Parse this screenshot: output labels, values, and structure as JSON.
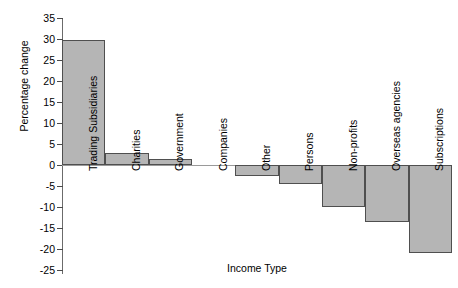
{
  "chart_data": {
    "type": "bar",
    "title": "",
    "subtitle": "",
    "xlabel": "Income Type",
    "ylabel": "Percentage change",
    "categories": [
      "Trading Subsidiaries",
      "Charities",
      "Government",
      "Companies",
      "Other",
      "Persons",
      "Non-profits",
      "Overseas agencies",
      "Subscriptions"
    ],
    "values": [
      29.8,
      2.8,
      1.5,
      0,
      -2.5,
      -4.5,
      -10,
      -13.5,
      -21
    ],
    "series": [
      {
        "name": "Percentage change",
        "values": [
          29.8,
          2.8,
          1.5,
          0,
          -2.5,
          -4.5,
          -10,
          -13.5,
          -21
        ]
      }
    ],
    "ylim": [
      -25,
      35
    ],
    "ytick_step": 5,
    "yticks": [
      35,
      30,
      25,
      20,
      15,
      10,
      5,
      0,
      -5,
      -10,
      -15,
      -20,
      -25
    ],
    "ytick_labels": [
      "35",
      "30",
      "25",
      "20",
      "15",
      "10",
      "5",
      "0",
      "-5",
      "-10",
      "-15",
      "-20",
      "-25"
    ],
    "grid": false,
    "legend": "none",
    "bar_fill_color": "#b5b5b5",
    "bar_edge_color": "#4f4f4f",
    "axis_color": "#6b6b6b",
    "background_color": "#ffffff"
  }
}
